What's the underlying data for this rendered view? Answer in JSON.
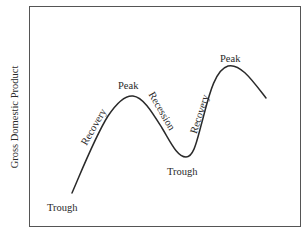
{
  "diagram": {
    "type": "business-cycle",
    "y_axis_label": "Gross Domestic Product",
    "x_axis_label": "",
    "line_color": "#2a2a2a",
    "frame_color": "#555555",
    "labels": {
      "trough_1": "Trough",
      "recovery_1": "Recovery",
      "peak_1": "Peak",
      "recession": "Recession",
      "trough_2": "Trough",
      "recovery_2": "Recovery",
      "peak_2": "Peak"
    },
    "phases": [
      {
        "name": "Trough",
        "order": 1
      },
      {
        "name": "Recovery",
        "order": 2
      },
      {
        "name": "Peak",
        "order": 3
      },
      {
        "name": "Recession",
        "order": 4
      },
      {
        "name": "Trough",
        "order": 5
      },
      {
        "name": "Recovery",
        "order": 6
      },
      {
        "name": "Peak",
        "order": 7
      }
    ]
  }
}
